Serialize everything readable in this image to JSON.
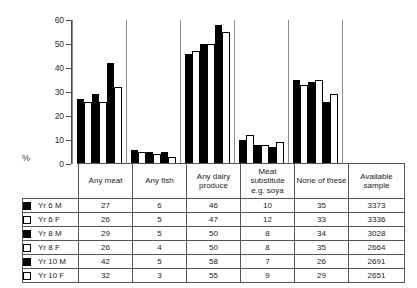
{
  "chart_data": {
    "type": "bar",
    "title": "",
    "xlabel": "",
    "ylabel": "%",
    "ylim": [
      0,
      60
    ],
    "yticks": [
      0,
      10,
      20,
      30,
      40,
      50,
      60
    ],
    "grid": false,
    "legend_position": "table-left-column",
    "categories": [
      "Any meat",
      "Any fish",
      "Any dairy produce",
      "Meat substitute e.g. soya",
      "None of these"
    ],
    "series": [
      {
        "name": "Yr 6 M",
        "fill": "black",
        "values": [
          27,
          6,
          46,
          10,
          35
        ],
        "available_sample": 3373
      },
      {
        "name": "Yr 6 F",
        "fill": "white",
        "values": [
          26,
          5,
          47,
          12,
          33
        ],
        "available_sample": 3336
      },
      {
        "name": "Yr 8 M",
        "fill": "black",
        "values": [
          29,
          5,
          50,
          8,
          34
        ],
        "available_sample": 3028
      },
      {
        "name": "Yr 8 F",
        "fill": "white",
        "values": [
          26,
          4,
          50,
          8,
          35
        ],
        "available_sample": 2664
      },
      {
        "name": "Yr 10 M",
        "fill": "black",
        "values": [
          42,
          5,
          58,
          7,
          26
        ],
        "available_sample": 2691
      },
      {
        "name": "Yr 10 F",
        "fill": "white",
        "values": [
          32,
          3,
          55,
          9,
          29
        ],
        "available_sample": 2651
      }
    ]
  },
  "axis": {
    "percent_symbol": "%",
    "ticks": [
      "60",
      "50",
      "40",
      "30",
      "20",
      "10",
      "0"
    ]
  },
  "table": {
    "headers": [
      "Any meat",
      "Any fish",
      "Any dairy produce",
      "Meat substitute e.g. soya",
      "None of these",
      "Available sample"
    ],
    "header_lines": {
      "any_meat": [
        "Any meat"
      ],
      "any_fish": [
        "Any fish"
      ],
      "any_dairy": [
        "Any dairy",
        "produce"
      ],
      "meat_sub": [
        "Meat",
        "substitute",
        "e.g. soya"
      ],
      "none_of_these": [
        "None of these"
      ],
      "available_sample": [
        "Available",
        "sample"
      ]
    },
    "rows": [
      {
        "label": "Yr 6 M",
        "swatch": "black",
        "any_meat": "27",
        "any_fish": "6",
        "any_dairy": "46",
        "meat_sub": "10",
        "none_of_these": "35",
        "available_sample": "3373"
      },
      {
        "label": "Yr 6 F",
        "swatch": "white",
        "any_meat": "26",
        "any_fish": "5",
        "any_dairy": "47",
        "meat_sub": "12",
        "none_of_these": "33",
        "available_sample": "3336"
      },
      {
        "label": "Yr 8 M",
        "swatch": "black",
        "any_meat": "29",
        "any_fish": "5",
        "any_dairy": "50",
        "meat_sub": "8",
        "none_of_these": "34",
        "available_sample": "3028"
      },
      {
        "label": "Yr 8 F",
        "swatch": "white",
        "any_meat": "26",
        "any_fish": "4",
        "any_dairy": "50",
        "meat_sub": "8",
        "none_of_these": "35",
        "available_sample": "2664"
      },
      {
        "label": "Yr 10 M",
        "swatch": "black",
        "any_meat": "42",
        "any_fish": "5",
        "any_dairy": "58",
        "meat_sub": "7",
        "none_of_these": "26",
        "available_sample": "2691"
      },
      {
        "label": "Yr 10 F",
        "swatch": "white",
        "any_meat": "32",
        "any_fish": "3",
        "any_dairy": "55",
        "meat_sub": "9",
        "none_of_these": "29",
        "available_sample": "2651"
      }
    ]
  },
  "colors": {
    "male_fill": "#000000",
    "female_fill": "#ffffff",
    "bar_outline": "#000000",
    "axis": "#4a4a4a",
    "table_border": "#555555"
  }
}
